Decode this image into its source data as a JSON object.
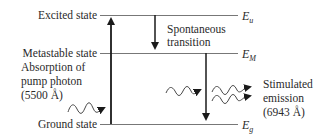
{
  "levels": [
    {
      "id": "upper",
      "label": "Excited state",
      "symbol": "E",
      "subscript": "u"
    },
    {
      "id": "meta",
      "label": "Metastable state",
      "symbol": "E",
      "subscript": "M"
    },
    {
      "id": "ground",
      "label": "Ground state",
      "symbol": "E",
      "subscript": "g"
    }
  ],
  "annotations": {
    "absorption": [
      "Absorption of",
      "pump photon",
      "(5500 Å)"
    ],
    "spontaneous": [
      "Spontaneous",
      "transition"
    ],
    "stimulated": [
      "Stimulated",
      "emission",
      "(6943 Å)"
    ]
  },
  "transitions": [
    {
      "name": "pump-absorption",
      "from": "ground",
      "to": "upper"
    },
    {
      "name": "spontaneous-decay",
      "from": "upper",
      "to": "meta"
    },
    {
      "name": "stimulated-emission",
      "from": "meta",
      "to": "ground"
    }
  ],
  "colors": {
    "ink": "#1a1a1a",
    "line": "#666666"
  }
}
